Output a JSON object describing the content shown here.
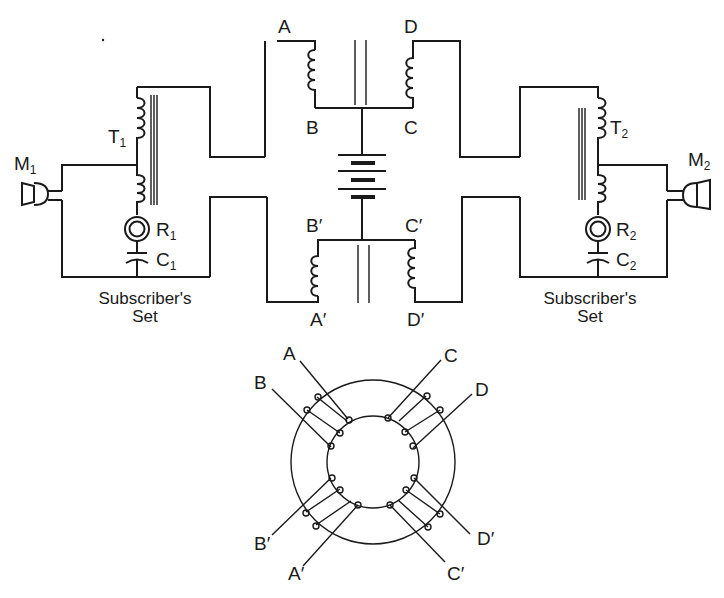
{
  "figure": {
    "colors": {
      "ink": "#1a1a1a",
      "background": "#ffffff"
    }
  },
  "left_set": {
    "microphone": {
      "main": "M",
      "sub": "1"
    },
    "transformer": {
      "main": "T",
      "sub": "1"
    },
    "receiver": {
      "main": "R",
      "sub": "1"
    },
    "capacitor": {
      "main": "C",
      "sub": "1"
    },
    "caption_line1": "Subscriber's",
    "caption_line2": "Set"
  },
  "right_set": {
    "microphone": {
      "main": "M",
      "sub": "2"
    },
    "transformer": {
      "main": "T",
      "sub": "2"
    },
    "receiver": {
      "main": "R",
      "sub": "2"
    },
    "capacitor": {
      "main": "C",
      "sub": "2"
    },
    "caption_line1": "Subscriber's",
    "caption_line2": "Set"
  },
  "repeating_coil": {
    "top_labels": {
      "a": "A",
      "b": "B",
      "c": "C",
      "d": "D"
    },
    "bottom_labels": {
      "a": "A′",
      "b": "B′",
      "c": "C′",
      "d": "D′"
    }
  },
  "toroid": {
    "labels": {
      "a": "A",
      "b": "B",
      "c": "C",
      "d": "D",
      "a_p": "A′",
      "b_p": "B′",
      "c_p": "C′",
      "d_p": "D′"
    }
  }
}
